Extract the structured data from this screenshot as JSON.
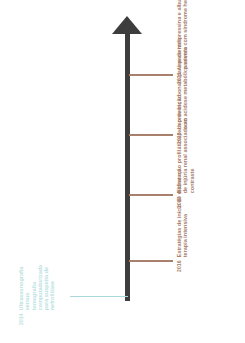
{
  "figure": {
    "type": "vertical-timeline",
    "orientation": "upward-arrow",
    "axis_color": "#3d3d3d",
    "right_event_color": "#a9806b",
    "left_event_color": "#b9e2e2"
  },
  "events": [
    {
      "year": "2021",
      "label": "Uso de terlipressina e albumina no paciente com síndrome hepatorrenal",
      "side": "right",
      "color": "#a9806b"
    },
    {
      "year": "2018",
      "label": "Uso de bicarbonato para pacientes com acidose metabólica severa",
      "side": "right",
      "color": "#a9806b"
    },
    {
      "year": "2017",
      "label": "Hidratação profilática para prevenção de injúria renal associada ao contraste",
      "side": "right",
      "color": "#a9806b"
    },
    {
      "year": "2016",
      "label": "Estratégias de início de diálise na terapia intensiva",
      "side": "right",
      "color": "#a9806b"
    },
    {
      "year": "2014",
      "label": "Ultrassonografia versus tomografia computadorizada para suspeita de nefrolitíase",
      "side": "left",
      "color": "#b9e2e2"
    }
  ]
}
